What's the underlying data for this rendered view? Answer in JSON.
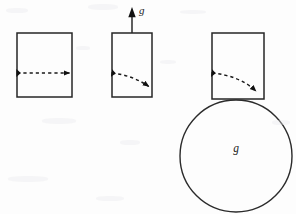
{
  "figure": {
    "background_color": "#fdfdfd",
    "stroke_color": "#1a1a1a",
    "width": 296,
    "height": 214,
    "labels": {
      "gravity_vector_label": "g",
      "circle_label": "g"
    },
    "panels": [
      {
        "name": "panel-1",
        "box": {
          "x": 17,
          "y": 33,
          "width": 55,
          "height": 64
        },
        "trajectory": {
          "shape": "straight",
          "start": {
            "x": 17,
            "y": 73
          },
          "end": {
            "x": 72,
            "y": 73
          },
          "control": {
            "x": 45,
            "y": 73
          },
          "dashed": true
        },
        "gravity_vector": null,
        "circle": null
      },
      {
        "name": "panel-2",
        "box": {
          "x": 112,
          "y": 33,
          "width": 40,
          "height": 64
        },
        "trajectory": {
          "shape": "curved",
          "start": {
            "x": 112,
            "y": 73
          },
          "end": {
            "x": 151,
            "y": 89
          },
          "control": {
            "x": 132,
            "y": 76
          },
          "dashed": true
        },
        "gravity_vector": {
          "from": {
            "x": 132,
            "y": 33
          },
          "to": {
            "x": 132,
            "y": 8
          },
          "direction": "up",
          "label": "g",
          "label_position": {
            "x": 139,
            "y": 12
          }
        },
        "circle": null
      },
      {
        "name": "panel-3",
        "box": {
          "x": 212,
          "y": 33,
          "width": 52,
          "height": 66
        },
        "trajectory": {
          "shape": "curved-strong",
          "start": {
            "x": 212,
            "y": 73
          },
          "end": {
            "x": 259,
            "y": 95
          },
          "control": {
            "x": 240,
            "y": 76
          },
          "dashed": true
        },
        "gravity_vector": null,
        "circle": {
          "cx": 236,
          "cy": 156,
          "r": 56,
          "label": "g",
          "label_position": {
            "x": 236,
            "y": 152
          }
        }
      }
    ]
  }
}
